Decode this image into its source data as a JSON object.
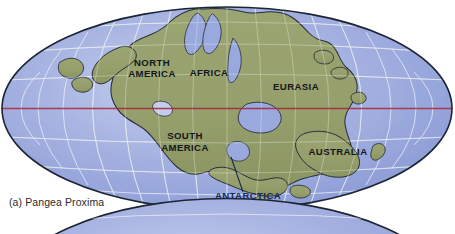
{
  "figure": {
    "caption": "(a) Pangea Proxima",
    "projection": "mollweide-ellipse",
    "colors": {
      "ocean_light": "#c3cdee",
      "ocean_mid": "#9aa8dd",
      "ocean_deep": "#8192d3",
      "land": "#96a06d",
      "land_shade": "#8a9462",
      "coastline": "#2a2f3a",
      "graticule": "#f2f4fb",
      "ellipse_outline": "#1d2433",
      "equator": "#a52f3f",
      "label_dark": "#14161c",
      "label_navy": "#182a52",
      "caption": "#2b2b2f",
      "page_background": "#ffffff"
    },
    "labels": [
      {
        "id": "north-america",
        "text": "NORTH",
        "x": 152,
        "y": 66,
        "size": 9.6,
        "color": "dark",
        "anchor": "middle"
      },
      {
        "id": "north-america2",
        "text": "AMERICA",
        "x": 152,
        "y": 77,
        "size": 9.6,
        "color": "dark",
        "anchor": "middle"
      },
      {
        "id": "africa",
        "text": "AFRICA",
        "x": 209,
        "y": 76,
        "size": 9.6,
        "color": "dark",
        "anchor": "middle"
      },
      {
        "id": "eurasia",
        "text": "EURASIA",
        "x": 296,
        "y": 90,
        "size": 9.6,
        "color": "dark",
        "anchor": "middle"
      },
      {
        "id": "south-america",
        "text": "SOUTH",
        "x": 185,
        "y": 139,
        "size": 9.6,
        "color": "dark",
        "anchor": "middle"
      },
      {
        "id": "south-america2",
        "text": "AMERICA",
        "x": 185,
        "y": 151,
        "size": 9.6,
        "color": "dark",
        "anchor": "middle"
      },
      {
        "id": "australia",
        "text": "AUSTRALIA",
        "x": 338,
        "y": 155,
        "size": 9.6,
        "color": "dark",
        "anchor": "middle"
      },
      {
        "id": "antarctica",
        "text": "ANTARCTICA",
        "x": 248,
        "y": 199,
        "size": 9.6,
        "color": "navy",
        "anchor": "middle"
      }
    ],
    "leader_line": {
      "x1": 243,
      "y1": 192,
      "x2": 231,
      "y2": 157
    },
    "equator_line": {
      "y": 108,
      "label": "equator"
    },
    "second_figure_visible": true
  }
}
